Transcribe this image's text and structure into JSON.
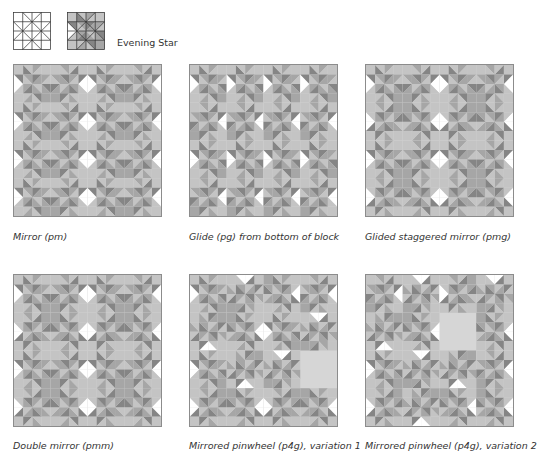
{
  "header": {
    "block_name": "Evening Star",
    "thumbnails": [
      {
        "name": "block-outline",
        "style": "line-drawing"
      },
      {
        "name": "block-shaded",
        "style": "shaded"
      }
    ]
  },
  "colors": {
    "dark": "#858585",
    "mid": "#a6a6a6",
    "light": "#c4c4c4",
    "pale": "#d8d8d8",
    "white": "#ffffff",
    "border": "#8c8c8c"
  },
  "panels": [
    {
      "caption": "Mirror (pm)"
    },
    {
      "caption": "Glide (pg) from bottom of block"
    },
    {
      "caption": "Glided staggered mirror (pmg)"
    },
    {
      "caption": "Double mirror (pmm)"
    },
    {
      "caption": "Mirrored pinwheel (p4g), variation 1"
    },
    {
      "caption": "Mirrored pinwheel (p4g), variation 2"
    }
  ]
}
